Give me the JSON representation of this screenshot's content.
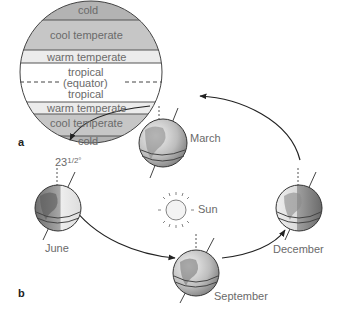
{
  "panel_a": {
    "label": "a",
    "bands": [
      {
        "name": "cold",
        "label": "cold",
        "color": "#b3b3b3"
      },
      {
        "name": "cool-temperate",
        "label": "cool temperate",
        "color": "#c6c6c6"
      },
      {
        "name": "warm-temperate",
        "label": "warm temperate",
        "color": "#e8e8e8"
      },
      {
        "name": "tropical-north",
        "label": "tropical",
        "color": "#ffffff"
      },
      {
        "name": "equator",
        "label": "(equator)",
        "color": "#ffffff"
      },
      {
        "name": "tropical-south",
        "label": "tropical",
        "color": "#ffffff"
      },
      {
        "name": "warm-temperate-south",
        "label": "warm temperate",
        "color": "#e8e8e8"
      },
      {
        "name": "cool-temperate-south",
        "label": "cool temperate",
        "color": "#c6c6c6"
      },
      {
        "name": "cold-south",
        "label": "cold",
        "color": "#b3b3b3"
      }
    ]
  },
  "panel_b": {
    "label": "b",
    "tilt_label": "23",
    "tilt_fraction": "1/2°",
    "sun_label": "Sun",
    "positions": {
      "march": "March",
      "june": "June",
      "september": "September",
      "december": "December"
    }
  }
}
